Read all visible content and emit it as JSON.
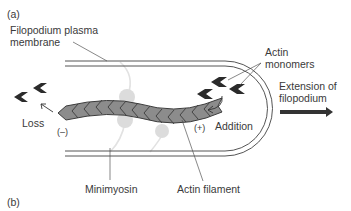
{
  "panel_labels": {
    "a": "(a)",
    "b": "(b)"
  },
  "labels": {
    "membrane_line1": "Filopodium plasma",
    "membrane_line2": "membrane",
    "monomers_line1": "Actin",
    "monomers_line2": "monomers",
    "extension_line1": "Extension of",
    "extension_line2": "filopodium",
    "loss": "Loss",
    "addition": "Addition",
    "minus_end": "(–)",
    "plus_end": "(+)",
    "minimyosin": "Minimyosin",
    "actin_filament": "Actin filament"
  },
  "colors": {
    "membrane": "#555555",
    "filament_fill": "#8c8c8c",
    "filament_stroke": "#3c3c3c",
    "monomer": "#2b2b2b",
    "myosin": "#dcdcdc",
    "arrow": "#333333"
  }
}
